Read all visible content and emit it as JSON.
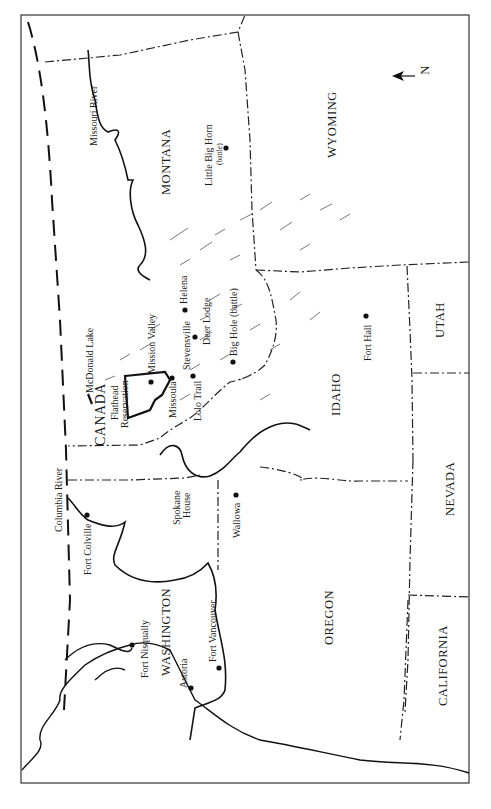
{
  "map": {
    "orientation": "rotated 90 degrees counterclockwise; north points left",
    "north_arrow": {
      "label": "N",
      "icon": "north-arrow-icon"
    },
    "countries": [
      {
        "name": "CANADA"
      }
    ],
    "states": [
      {
        "name": "MONTANA"
      },
      {
        "name": "WYOMING"
      },
      {
        "name": "IDAHO"
      },
      {
        "name": "UTAH"
      },
      {
        "name": "NEVADA"
      },
      {
        "name": "OREGON"
      },
      {
        "name": "CALIFORNIA"
      },
      {
        "name": "WASHINGTON"
      }
    ],
    "rivers": [
      {
        "name": "Missouri River"
      },
      {
        "name": "Columbia River"
      }
    ],
    "places": [
      {
        "name": "Little Big Horn",
        "note": "(battle)"
      },
      {
        "name": "Helena"
      },
      {
        "name": "Deer Lodge"
      },
      {
        "name": "Big Hole",
        "note": "(battle)"
      },
      {
        "name": "Fort Hall"
      },
      {
        "name": "Mission Valley"
      },
      {
        "name": "Stevensville"
      },
      {
        "name": "Missoula"
      },
      {
        "name": "Lolo Trail"
      },
      {
        "name": "McDonald Lake"
      },
      {
        "name": "Flathead Reservation"
      },
      {
        "name": "Spokane House"
      },
      {
        "name": "Fort Colville"
      },
      {
        "name": "Wallowa"
      },
      {
        "name": "Fort Nisqually"
      },
      {
        "name": "Astoria"
      },
      {
        "name": "Fort Vancouver"
      }
    ],
    "labels": {
      "canada": "CANADA",
      "montana": "MONTANA",
      "wyoming": "WYOMING",
      "idaho": "IDAHO",
      "utah": "UTAH",
      "nevada": "NEVADA",
      "oregon": "OREGON",
      "california": "CALIFORNIA",
      "washington": "WASHINGTON",
      "missouri_river": "Missouri River",
      "columbia_river": "Columbia River",
      "little_big_horn": "Little Big Horn",
      "little_big_horn_note": "(battle)",
      "helena": "Helena",
      "deer_lodge": "Deer Lodge",
      "big_hole": "Big Hole (battle)",
      "fort_hall": "Fort Hall",
      "mission_valley": "Mission Valley",
      "stevensville": "Stevensville",
      "missoula": "Missoula",
      "lolo_trail": "Lolo Trail",
      "mcdonald_lake": "McDonald Lake",
      "flathead_1": "Flathead",
      "flathead_2": "Reservation",
      "spokane_1": "Spokane",
      "spokane_2": "House",
      "fort_colville": "Fort Colville",
      "wallowa": "Wallowa",
      "fort_nisqually": "Fort Nisqually",
      "astoria": "Astoria",
      "fort_vancouver": "Fort Vancouver",
      "north": "N"
    }
  }
}
